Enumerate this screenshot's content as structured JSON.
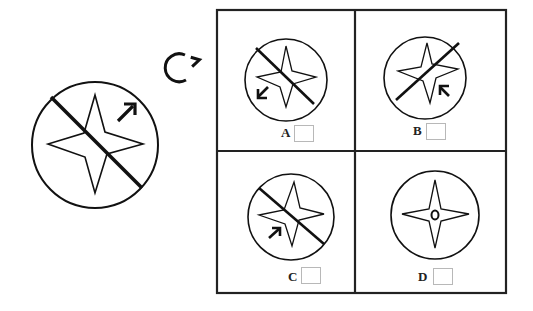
{
  "puzzle": {
    "type": "rotation-matching",
    "rotation_icon": "clockwise-rotate-icon",
    "source_figure": {
      "shape": "four-point-star-in-circle",
      "line": "diagonal top-left to bottom-right",
      "arrow": "up-right arrow in upper-right"
    },
    "options": [
      {
        "label": "A",
        "line": "top-left to bottom-right",
        "arrow": "down-left arrow in lower-left",
        "checkbox_checked": false
      },
      {
        "label": "B",
        "line": "bottom-left to top-right",
        "arrow": "up-left arrow in lower-right",
        "checkbox_checked": false
      },
      {
        "label": "C",
        "line": "top-left to bottom-right",
        "arrow": "up-right arrow in lower-left",
        "checkbox_checked": false
      },
      {
        "label": "D",
        "line": "none",
        "arrow": "none",
        "center_mark": "small circle",
        "checkbox_checked": false
      }
    ]
  },
  "colors": {
    "stroke": "#111111",
    "grid": "#222222",
    "checkbox_border": "#b8b8b8",
    "background": "#ffffff"
  }
}
